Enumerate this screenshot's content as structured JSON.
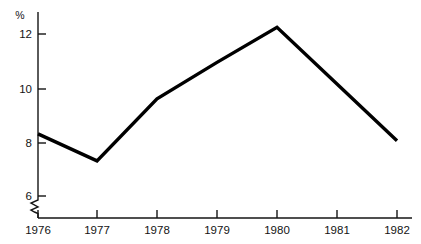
{
  "chart_data": {
    "type": "line",
    "title": "",
    "subtitle": "",
    "xlabel": "",
    "ylabel": "%",
    "y_unit_label": "%",
    "categories": [
      "1976",
      "1977",
      "1978",
      "1979",
      "1980",
      "1981",
      "1982"
    ],
    "x": [
      1976,
      1977,
      1978,
      1979,
      1980,
      1981,
      1982
    ],
    "values": [
      8.3,
      7.3,
      9.6,
      10.95,
      12.25,
      10.15,
      8.05
    ],
    "series": [
      {
        "name": "",
        "values": [
          8.3,
          7.3,
          9.6,
          10.95,
          12.25,
          10.15,
          8.05
        ]
      }
    ],
    "ylim": [
      5.3,
      12.9
    ],
    "y_ticks": [
      6,
      10.0,
      8,
      12
    ],
    "y_tick_labels": [
      "6",
      "8",
      "10",
      "12"
    ],
    "y_tick_values": [
      6,
      8,
      10,
      12
    ],
    "x_tick_labels": [
      "1976",
      "1977",
      "1978",
      "1979",
      "1980",
      "1981",
      "1982"
    ],
    "grid": false,
    "legend": false,
    "legend_position": "none",
    "axis_break": true,
    "axis_break_note": "zigzag break on y-axis below the 6 tick",
    "annotations": [],
    "line_color": "#000000",
    "axis_color": "#141414",
    "background_color": "#ffffff"
  }
}
